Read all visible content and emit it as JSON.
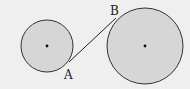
{
  "diagram": {
    "background": "#efefef",
    "circle_fill": "#d6d6d6",
    "stroke": "#333333",
    "circles": [
      {
        "name": "small-circle",
        "cx": 47,
        "cy": 46,
        "r": 26
      },
      {
        "name": "large-circle",
        "cx": 145,
        "cy": 46,
        "r": 38
      }
    ],
    "segment": {
      "from": "A",
      "to": "B",
      "x1": 69,
      "y1": 62,
      "x2": 116,
      "y2": 18
    },
    "labels": {
      "A": "A",
      "B": "B"
    }
  }
}
